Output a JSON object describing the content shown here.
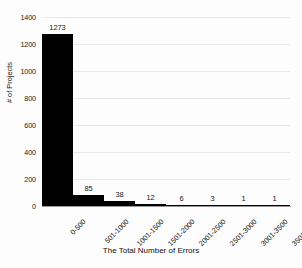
{
  "chart_data": {
    "type": "bar",
    "title": "",
    "subtitle": "",
    "xlabel": "The Total Number of Errors",
    "ylabel": "# of Projects",
    "categories": [
      "0-500",
      "501-1000",
      "1001-1500",
      "1501-2000",
      "2001-2500",
      "2501-3000",
      "3001-3500",
      "3501-4000"
    ],
    "values": [
      1273,
      85,
      38,
      12,
      6,
      3,
      1,
      1
    ],
    "data_labels": [
      "1273",
      "85",
      "38",
      "12",
      "6",
      "3",
      "1",
      "1"
    ],
    "ylim": [
      0,
      1400
    ],
    "yticks": [
      0,
      200,
      400,
      600,
      800,
      1000,
      1200,
      1400
    ],
    "ytick_labels": [
      "0",
      "200",
      "400",
      "600",
      "800",
      "1000",
      "1200",
      "1400"
    ],
    "grid": true,
    "grid_axis": "y",
    "legend": false,
    "legend_position": "none",
    "bar_color": "#000000",
    "grid_color": "#e9e9e9",
    "axis_color": "#9a9a9a",
    "background_color": "#fdfdfd",
    "xtick_rotation": -45,
    "bar_gap": 0
  }
}
